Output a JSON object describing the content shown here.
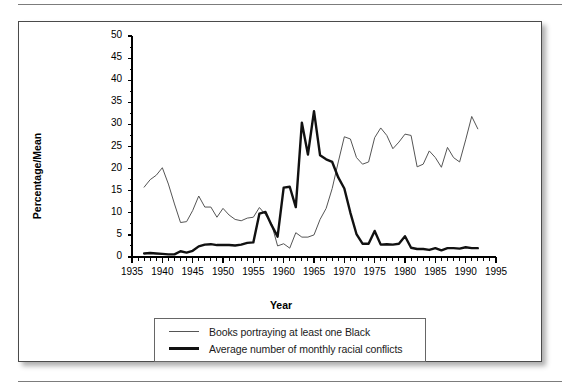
{
  "figure": {
    "y_axis_title": "Percentage/Mean",
    "x_axis_title": "Year"
  },
  "legend": {
    "items": [
      {
        "label": "Books portraying at least one Black",
        "style": "thin"
      },
      {
        "label": "Average number of monthly racial conflicts",
        "style": "bold"
      }
    ]
  },
  "chart_data": {
    "type": "line",
    "title": "",
    "xlabel": "Year",
    "ylabel": "Percentage/Mean",
    "xlim": [
      1935,
      1995
    ],
    "ylim": [
      0,
      50
    ],
    "xticks": [
      1935,
      1940,
      1945,
      1950,
      1955,
      1960,
      1965,
      1970,
      1975,
      1980,
      1985,
      1990,
      1995
    ],
    "yticks": [
      0,
      5,
      10,
      15,
      20,
      25,
      30,
      35,
      40,
      45,
      50
    ],
    "minor_xtick_interval": 1,
    "grid": false,
    "legend_position": "below-axes",
    "series": [
      {
        "name": "Books portraying at least one Black",
        "color": "#555555",
        "linewidth": 1,
        "x": [
          1937,
          1938,
          1939,
          1940,
          1941,
          1942,
          1943,
          1944,
          1945,
          1946,
          1947,
          1948,
          1949,
          1950,
          1951,
          1952,
          1953,
          1954,
          1955,
          1956,
          1957,
          1958,
          1959,
          1960,
          1961,
          1962,
          1963,
          1964,
          1965,
          1966,
          1967,
          1968,
          1969,
          1970,
          1971,
          1972,
          1973,
          1974,
          1975,
          1976,
          1977,
          1978,
          1979,
          1980,
          1981,
          1982,
          1983,
          1984,
          1985,
          1986,
          1987,
          1988,
          1989,
          1990,
          1991,
          1992
        ],
        "values": [
          15.8,
          17.5,
          18.5,
          20.2,
          16.5,
          12.0,
          7.8,
          8.0,
          10.5,
          13.8,
          11.3,
          11.3,
          9.0,
          11.0,
          9.5,
          8.5,
          8.2,
          8.8,
          9.0,
          11.2,
          9.6,
          7.5,
          2.5,
          3.0,
          2.0,
          5.5,
          4.5,
          4.5,
          5.0,
          8.5,
          11.0,
          15.5,
          21.5,
          27.2,
          26.7,
          22.5,
          21.0,
          21.5,
          27.0,
          29.2,
          27.5,
          24.5,
          26.0,
          27.8,
          27.5,
          20.4,
          21.0,
          24.0,
          22.5,
          20.3,
          24.8,
          22.5,
          21.5,
          26.5,
          31.8,
          29.0
        ]
      },
      {
        "name": "Average number of monthly racial conflicts",
        "color": "#111111",
        "linewidth": 2.4,
        "x": [
          1937,
          1938,
          1939,
          1940,
          1941,
          1942,
          1943,
          1944,
          1945,
          1946,
          1947,
          1948,
          1949,
          1950,
          1951,
          1952,
          1953,
          1954,
          1955,
          1956,
          1957,
          1958,
          1959,
          1960,
          1961,
          1962,
          1963,
          1964,
          1965,
          1966,
          1967,
          1968,
          1969,
          1970,
          1971,
          1972,
          1973,
          1974,
          1975,
          1976,
          1977,
          1978,
          1979,
          1980,
          1981,
          1982,
          1983,
          1984,
          1985,
          1986,
          1987,
          1988,
          1989,
          1990,
          1991,
          1992
        ],
        "values": [
          0.8,
          0.9,
          0.8,
          0.7,
          0.6,
          0.6,
          1.3,
          1.0,
          1.4,
          2.4,
          2.8,
          2.9,
          2.7,
          2.7,
          2.7,
          2.6,
          2.8,
          3.2,
          3.3,
          9.8,
          10.2,
          7.2,
          4.6,
          15.7,
          15.9,
          11.3,
          30.4,
          23.2,
          33.0,
          23.0,
          22.1,
          21.5,
          18.0,
          15.5,
          10.0,
          5.2,
          3.0,
          3.0,
          5.9,
          2.8,
          2.9,
          2.8,
          3.0,
          4.7,
          2.1,
          1.8,
          1.8,
          1.6,
          2.0,
          1.5,
          2.0,
          2.0,
          1.9,
          2.2,
          2.0,
          2.0
        ]
      }
    ]
  }
}
